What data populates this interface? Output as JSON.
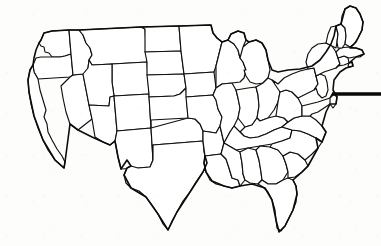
{
  "figure": {
    "width": 381,
    "height": 246,
    "background_color": "#fdfdfc",
    "line_color": "#100f0d",
    "fill_color": "#ffffff",
    "has_labels": false,
    "has_legend": false,
    "style": "line-art outline, no shading, no text"
  },
  "annotation": {
    "pointer_label": "pointer-line",
    "points_at": "Maryland / Delaware (Chesapeake Bay)",
    "color": "#0a0a09",
    "x_start": 332,
    "x_end": 381,
    "y": 94,
    "thickness": 3.4
  },
  "regions": [
    {
      "code": "WA",
      "name": "Washington"
    },
    {
      "code": "OR",
      "name": "Oregon"
    },
    {
      "code": "CA",
      "name": "California"
    },
    {
      "code": "NV",
      "name": "Nevada"
    },
    {
      "code": "ID",
      "name": "Idaho"
    },
    {
      "code": "MT",
      "name": "Montana"
    },
    {
      "code": "WY",
      "name": "Wyoming"
    },
    {
      "code": "UT",
      "name": "Utah"
    },
    {
      "code": "AZ",
      "name": "Arizona"
    },
    {
      "code": "CO",
      "name": "Colorado"
    },
    {
      "code": "NM",
      "name": "New Mexico"
    },
    {
      "code": "ND",
      "name": "North Dakota"
    },
    {
      "code": "SD",
      "name": "South Dakota"
    },
    {
      "code": "NE",
      "name": "Nebraska"
    },
    {
      "code": "KS",
      "name": "Kansas"
    },
    {
      "code": "OK",
      "name": "Oklahoma"
    },
    {
      "code": "TX",
      "name": "Texas"
    },
    {
      "code": "MN",
      "name": "Minnesota"
    },
    {
      "code": "IA",
      "name": "Iowa"
    },
    {
      "code": "MO",
      "name": "Missouri"
    },
    {
      "code": "AR",
      "name": "Arkansas"
    },
    {
      "code": "LA",
      "name": "Louisiana"
    },
    {
      "code": "WI",
      "name": "Wisconsin"
    },
    {
      "code": "IL",
      "name": "Illinois"
    },
    {
      "code": "MI",
      "name": "Michigan"
    },
    {
      "code": "IN",
      "name": "Indiana"
    },
    {
      "code": "OH",
      "name": "Ohio"
    },
    {
      "code": "KY",
      "name": "Kentucky"
    },
    {
      "code": "TN",
      "name": "Tennessee"
    },
    {
      "code": "MS",
      "name": "Mississippi"
    },
    {
      "code": "AL",
      "name": "Alabama"
    },
    {
      "code": "GA",
      "name": "Georgia"
    },
    {
      "code": "FL",
      "name": "Florida"
    },
    {
      "code": "SC",
      "name": "South Carolina"
    },
    {
      "code": "NC",
      "name": "North Carolina"
    },
    {
      "code": "VA",
      "name": "Virginia"
    },
    {
      "code": "WV",
      "name": "West Virginia"
    },
    {
      "code": "MD",
      "name": "Maryland"
    },
    {
      "code": "DE",
      "name": "Delaware"
    },
    {
      "code": "PA",
      "name": "Pennsylvania"
    },
    {
      "code": "NJ",
      "name": "New Jersey"
    },
    {
      "code": "NY",
      "name": "New York"
    },
    {
      "code": "CT",
      "name": "Connecticut"
    },
    {
      "code": "RI",
      "name": "Rhode Island"
    },
    {
      "code": "MA",
      "name": "Massachusetts"
    },
    {
      "code": "VT",
      "name": "Vermont"
    },
    {
      "code": "NH",
      "name": "New Hampshire"
    },
    {
      "code": "ME",
      "name": "Maine"
    }
  ],
  "geometry": {
    "states": {
      "WA": "M41,40 L44,33 L52,31 L69,30 L71,54 L65,56 L60,57 L52,57 L49,53 L45,52 L44,47 L41,46 L39,43 Z",
      "OR": "M36,58 L41,57 L49,57 L60,57 L65,56 L71,54 L73,75 L70,77 L38,79 L34,72 L33,65 Z",
      "CA": "M33,65 L34,72 L38,79 L40,90 L43,100 L46,110 L44,117 L47,124 L48,132 L52,140 L57,149 L62,156 L65,162 L64,168 L55,160 L48,150 L43,140 L38,128 L34,116 L31,104 L29,92 L28,80 L30,70 Z",
      "NV": "M70,77 L73,75 L83,74 L89,105 L92,119 L78,130 L70,124 L66,112 L63,98 L61,86 Z",
      "ID": "M71,54 L69,30 L79,30 L83,35 L86,43 L90,48 L92,55 L89,60 L88,68 L85,73 L83,74 L73,75 Z",
      "MT": "M79,30 L141,27 L145,29 L147,62 L112,64 L92,65 L89,60 L92,55 L90,48 L86,43 L83,35 Z",
      "WY": "M112,64 L147,62 L149,94 L114,96 L112,82 Z",
      "UT": "M89,105 L83,74 L88,68 L89,60 L92,65 L112,64 L112,82 L114,96 L110,97 L109,106 Z",
      "AZ": "M92,119 L89,105 L109,106 L110,97 L114,96 L117,131 L115,141 L110,145 L103,142 L95,137 Z",
      "CO": "M114,96 L149,94 L151,128 L117,131 L114,96 Z",
      "NM": "M117,131 L151,128 L153,160 L150,167 L138,168 L121,169 L118,157 L115,141 Z",
      "ND": "M141,27 L179,26 L181,51 L145,52 L145,29 Z",
      "SD": "M145,52 L181,51 L184,74 L147,75 L147,62 Z",
      "NE": "M147,75 L184,74 L186,88 L180,94 L174,96 L149,97 L149,94 Z",
      "KS": "M149,97 L174,96 L180,94 L186,88 L188,118 L151,120 L151,128 Z",
      "OK": "M151,128 L188,118 L195,119 L200,124 L203,131 L203,141 L178,143 L153,145 L153,160 L151,128 Z",
      "TX": "M153,145 L178,143 L203,141 L204,152 L207,163 L203,172 L196,182 L190,192 L183,201 L177,212 L172,221 L168,230 L163,224 L158,214 L152,205 L146,197 L139,191 L131,188 L126,183 L124,175 L127,168 L131,166 L138,168 L150,167 L153,160 Z",
      "MN": "M179,26 L211,25 L213,33 L217,38 L222,42 L220,50 L218,58 L216,66 L214,72 L184,74 L181,51 Z",
      "IA": "M184,74 L214,72 L216,88 L213,95 L186,97 L186,88 Z",
      "MO": "M186,97 L213,95 L216,100 L218,109 L222,117 L220,126 L216,133 L203,131 L200,124 L195,119 L188,118 L186,97 Z",
      "AR": "M203,131 L216,133 L220,126 L224,143 L221,154 L205,156 L203,141 Z",
      "LA": "M205,156 L221,154 L226,159 L229,168 L232,178 L238,180 L240,186 L232,188 L224,186 L216,184 L210,180 L206,172 L204,163 Z",
      "WI": "M216,66 L218,58 L220,50 L222,42 L228,40 L234,44 L238,50 L240,58 L243,62 L246,70 L244,78 L240,82 L232,83 L222,84 L216,88 Z",
      "IL": "M222,84 L232,83 L236,90 L238,98 L240,108 L238,118 L234,126 L230,132 L224,143 L220,126 L222,117 L218,109 L216,100 L213,95 L216,88 Z",
      "MI": "M240,58 L243,47 L249,42 L256,40 L262,43 L266,50 L268,60 L270,70 L268,78 L263,83 L256,84 L250,82 L246,76 L244,70 L246,70 L243,62 Z M228,40 L231,34 L238,31 L244,33 L246,40 L243,47 L240,58 L238,50 L234,44 Z",
      "IN": "M238,98 L236,90 L248,88 L256,87 L258,95 L259,106 L257,118 L252,125 L245,127 L238,118 L240,108 Z",
      "OH": "M256,87 L263,83 L268,78 L272,80 L278,84 L280,92 L278,102 L274,110 L268,118 L260,121 L257,118 L259,106 L258,95 Z",
      "KY": "M245,127 L252,125 L257,118 L260,121 L268,118 L276,116 L284,118 L288,122 L282,127 L274,130 L266,134 L258,137 L250,138 L244,136 L240,132 Z",
      "TN": "M224,143 L230,132 L234,126 L240,132 L244,136 L250,138 L258,137 L266,134 L274,130 L282,127 L292,130 L290,138 L282,141 L272,144 L260,146 L248,148 L236,150 L224,143 Z",
      "MS": "M221,154 L224,143 L236,150 L240,152 L242,163 L243,174 L245,180 L240,186 L238,180 L232,178 L229,168 L226,159 Z",
      "AL": "M240,152 L248,148 L256,150 L259,160 L261,172 L262,180 L258,184 L250,183 L245,180 L243,174 L242,163 Z",
      "GA": "M256,150 L260,146 L270,147 L278,150 L283,156 L286,164 L288,172 L283,180 L276,184 L268,184 L262,180 L261,172 L259,160 Z",
      "FL": "M262,180 L268,184 L276,184 L283,180 L288,178 L293,180 L296,186 L297,194 L296,202 L293,210 L289,218 L285,226 L281,231 L277,228 L276,220 L275,210 L272,200 L268,192 L263,187 L258,184 Z",
      "SC": "M283,156 L290,152 L298,154 L305,160 L308,166 L302,172 L295,177 L288,178 L288,172 L286,164 Z",
      "NC": "M290,138 L292,130 L300,131 L308,134 L316,138 L322,142 L318,148 L312,154 L305,160 L298,154 L290,152 L283,156 L278,150 L270,147 L272,144 L282,141 Z",
      "VA": "M288,122 L294,118 L302,116 L310,116 L316,120 L322,126 L326,132 L322,142 L316,138 L308,134 L300,131 L292,130 L282,127 L288,122 Z",
      "WV": "M280,92 L286,90 L292,92 L298,98 L302,106 L302,116 L294,118 L288,122 L284,118 L276,116 L278,102 Z",
      "MD": "M302,106 L310,104 L318,102 L324,100 L330,98 L332,94 L334,100 L330,104 L324,108 L318,112 L312,114 L310,116 L302,116 Z",
      "DE": "M330,98 L334,94 L337,97 L336,104 L333,108 L330,104 Z",
      "PA": "M278,84 L284,78 L292,74 L300,71 L308,69 L314,68 L316,76 L318,84 L314,90 L308,93 L302,96 L298,98 L292,92 L286,90 L280,92 L272,80 Z",
      "NJ": "M316,76 L320,74 L325,76 L327,82 L328,90 L326,96 L322,98 L318,94 L316,88 L314,90 L318,84 Z",
      "NY": "M308,69 L306,62 L308,54 L312,48 L318,44 L326,43 L332,46 L336,52 L338,58 L340,64 L336,68 L330,70 L324,72 L320,74 L316,76 L314,68 Z",
      "CT": "M338,58 L344,56 L348,58 L349,63 L344,65 L338,66 L336,68 L340,64 Z",
      "RI": "M349,63 L352,62 L353,66 L350,67 L348,66 Z",
      "MA": "M336,52 L340,48 L348,47 L356,48 L362,50 L364,54 L360,57 L354,57 L349,58 L344,56 L338,58 Z",
      "VT": "M326,43 L328,34 L331,27 L336,26 L338,34 L337,42 L336,48 L332,46 Z",
      "NH": "M336,26 L341,24 L345,28 L346,36 L345,44 L342,48 L338,48 L337,42 L338,34 Z",
      "ME": "M341,24 L342,16 L345,9 L350,6 L356,8 L360,14 L363,22 L362,30 L358,38 L354,44 L350,47 L345,44 L346,36 L345,28 Z"
    },
    "nation_outline": "M28,80 L30,70 L33,65 L34,58 L36,50 L39,43 L41,40 L44,33 L52,31 L69,30 L79,30 L141,27 L179,26 L211,25 L213,33 L217,38 L222,42 L228,40 L231,34 L238,31 L244,33 L246,40 L249,42 L256,40 L262,43 L266,50 L268,60 L272,70 L278,72 L288,70 L300,69 L312,66 L320,60 L326,52 L331,44 L334,36 L336,26 L341,24 L345,9 L350,6 L356,8 L360,14 L363,22 L362,30 L356,42 L350,48 L356,48 L362,50 L364,54 L356,57 L349,63 L352,62 L353,66 L346,68 L340,72 L334,80 L333,90 L337,97 L336,104 L330,104 L326,112 L322,126 L326,132 L322,142 L316,138 L318,148 L308,166 L302,172 L293,180 L296,186 L297,194 L293,210 L285,226 L279,232 L276,220 L272,200 L265,188 L252,184 L240,186 L232,188 L224,186 L212,181 L206,172 L204,163 L205,156 L207,163 L203,172 L190,192 L177,212 L168,230 L158,214 L146,197 L131,188 L124,175 L127,168 L131,166 L127,160 L121,169 L118,157 L115,141 L110,145 L103,142 L92,137 L78,130 L70,124 L65,162 L64,168 L55,160 L43,140 L34,116 L29,92 Z"
  }
}
